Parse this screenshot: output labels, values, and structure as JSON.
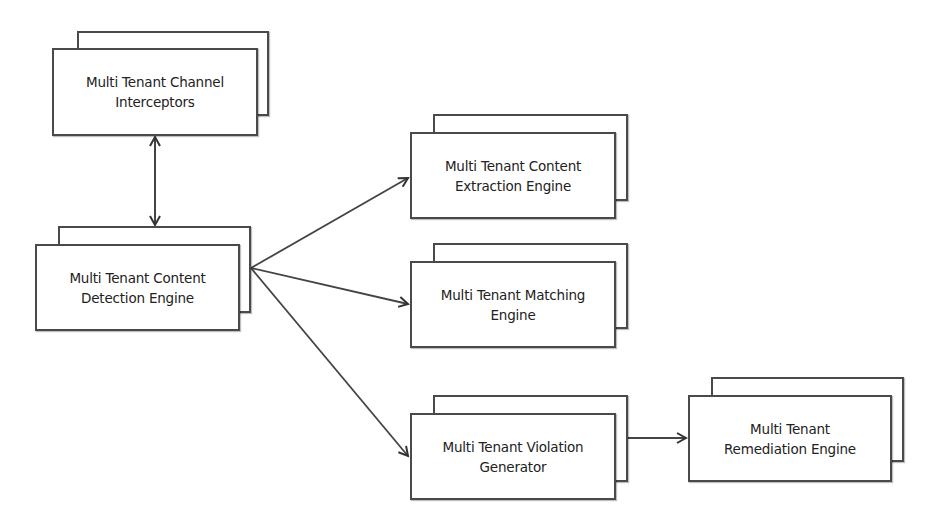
{
  "diagram": {
    "nodes": [
      {
        "id": "channel-interceptors",
        "label": "Multi Tenant Channel\nInterceptors",
        "back": [
          77,
          31,
          192,
          85
        ],
        "front": [
          52,
          48,
          206,
          88
        ]
      },
      {
        "id": "content-detection",
        "label": "Multi Tenant Content\nDetection Engine",
        "back": [
          58,
          226,
          193,
          87
        ],
        "front": [
          35,
          244,
          205,
          87
        ]
      },
      {
        "id": "content-extraction",
        "label": "Multi Tenant Content\nExtraction Engine",
        "back": [
          433,
          114,
          195,
          87
        ],
        "front": [
          410,
          132,
          206,
          87
        ]
      },
      {
        "id": "matching",
        "label": "Multi Tenant Matching\nEngine",
        "back": [
          433,
          243,
          195,
          86
        ],
        "front": [
          410,
          261,
          206,
          87
        ]
      },
      {
        "id": "violation-generator",
        "label": "Multi Tenant Violation\nGenerator",
        "back": [
          433,
          395,
          195,
          87
        ],
        "front": [
          410,
          413,
          206,
          87
        ]
      },
      {
        "id": "remediation",
        "label": "Multi Tenant\nRemediation Engine",
        "back": [
          711,
          377,
          193,
          85
        ],
        "front": [
          688,
          395,
          204,
          87
        ]
      }
    ],
    "edges": [
      {
        "from": "channel-interceptors",
        "to": "content-detection",
        "bidirectional": true
      },
      {
        "from": "content-detection",
        "to": "content-extraction",
        "bidirectional": false
      },
      {
        "from": "content-detection",
        "to": "matching",
        "bidirectional": false
      },
      {
        "from": "content-detection",
        "to": "violation-generator",
        "bidirectional": false
      },
      {
        "from": "violation-generator",
        "to": "remediation",
        "bidirectional": false
      }
    ],
    "colors": {
      "stroke": "#4a4a4a",
      "fill": "#ffffff",
      "text": "#222222"
    }
  }
}
